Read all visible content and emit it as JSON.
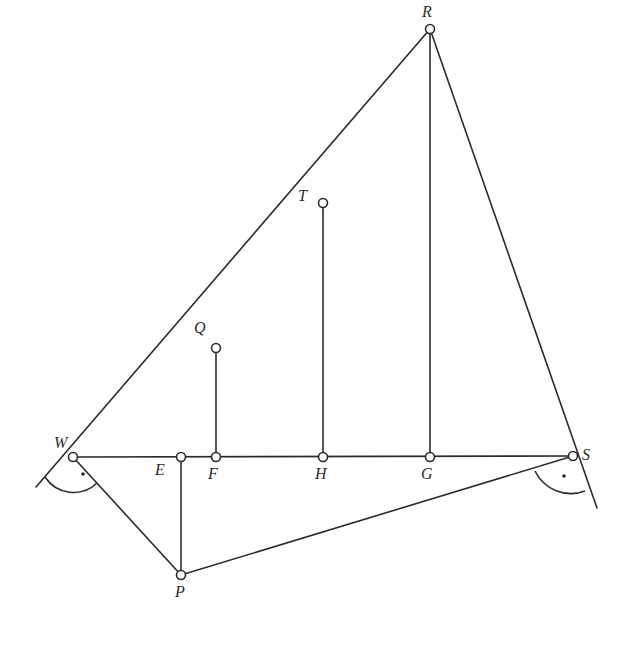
{
  "diagram": {
    "type": "geometry-construction",
    "points": [
      {
        "id": "W",
        "label": "W",
        "x": 73,
        "y": 457,
        "lx": 54,
        "ly": 448
      },
      {
        "id": "E",
        "label": "E",
        "x": 181,
        "y": 457,
        "lx": 155,
        "ly": 475
      },
      {
        "id": "F",
        "label": "F",
        "x": 216,
        "y": 457,
        "lx": 208,
        "ly": 479
      },
      {
        "id": "H",
        "label": "H",
        "x": 323,
        "y": 457,
        "lx": 315,
        "ly": 479
      },
      {
        "id": "G",
        "label": "G",
        "x": 430,
        "y": 457,
        "lx": 421,
        "ly": 479
      },
      {
        "id": "S",
        "label": "S",
        "x": 573,
        "y": 456,
        "lx": 582,
        "ly": 460
      },
      {
        "id": "Q",
        "label": "Q",
        "x": 216,
        "y": 348,
        "lx": 194,
        "ly": 333
      },
      {
        "id": "T",
        "label": "T",
        "x": 323,
        "y": 203,
        "lx": 298,
        "ly": 201
      },
      {
        "id": "R",
        "label": "R",
        "x": 430,
        "y": 29,
        "lx": 422,
        "ly": 17
      },
      {
        "id": "P",
        "label": "P",
        "x": 181,
        "y": 575,
        "lx": 175,
        "ly": 597
      }
    ],
    "segments": [
      {
        "from": [
          36,
          487
        ],
        "to": [
          430,
          29
        ],
        "name": "line-W-R"
      },
      {
        "from": [
          430,
          29
        ],
        "to": [
          597,
          508
        ],
        "name": "line-R-S"
      },
      {
        "from": [
          73,
          457
        ],
        "to": [
          573,
          456
        ],
        "name": "segment-W-S"
      },
      {
        "from": [
          73,
          457
        ],
        "to": [
          181,
          575
        ],
        "name": "segment-W-P"
      },
      {
        "from": [
          181,
          575
        ],
        "to": [
          573,
          456
        ],
        "name": "segment-P-S"
      },
      {
        "from": [
          181,
          457
        ],
        "to": [
          181,
          575
        ],
        "name": "segment-E-P"
      },
      {
        "from": [
          216,
          348
        ],
        "to": [
          216,
          457
        ],
        "name": "segment-Q-F"
      },
      {
        "from": [
          323,
          203
        ],
        "to": [
          323,
          457
        ],
        "name": "segment-T-H"
      },
      {
        "from": [
          430,
          29
        ],
        "to": [
          430,
          457
        ],
        "name": "segment-R-G"
      }
    ],
    "right_angles": [
      {
        "at": "W",
        "arc": "M 45 477 A 34 34 0 0 0 97 483",
        "dot": [
          83,
          474
        ]
      },
      {
        "at": "S",
        "arc": "M 535 471 A 40 40 0 0 0 585 491",
        "dot": [
          564,
          476
        ]
      }
    ]
  }
}
